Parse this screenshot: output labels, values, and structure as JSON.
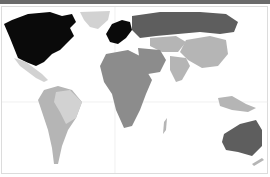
{
  "map": {
    "type": "choropleth-world-map",
    "colors": {
      "darkest": "#0a0a0a",
      "dark": "#5e5e5e",
      "medium": "#8c8c8c",
      "light": "#b5b5b5",
      "lightest": "#d2d2d2",
      "ocean": "#ffffff",
      "gridline": "#e6e6e6",
      "topbar": "#6b6b6b"
    },
    "regions": [
      {
        "name": "north-america",
        "shade": "darkest"
      },
      {
        "name": "greenland",
        "shade": "lightest"
      },
      {
        "name": "mexico",
        "shade": "lightest"
      },
      {
        "name": "south-america",
        "shade": "light"
      },
      {
        "name": "brazil",
        "shade": "lightest"
      },
      {
        "name": "western-europe",
        "shade": "darkest"
      },
      {
        "name": "russia",
        "shade": "dark"
      },
      {
        "name": "middle-east",
        "shade": "medium"
      },
      {
        "name": "central-asia",
        "shade": "light"
      },
      {
        "name": "china",
        "shade": "light"
      },
      {
        "name": "india",
        "shade": "light"
      },
      {
        "name": "africa",
        "shade": "medium"
      },
      {
        "name": "southeast-asia",
        "shade": "light"
      },
      {
        "name": "australia",
        "shade": "dark"
      }
    ]
  }
}
